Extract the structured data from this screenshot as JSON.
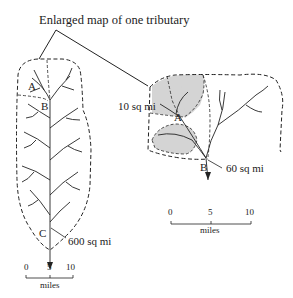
{
  "title": "Enlarged map of one tributary",
  "left_map": {
    "points": {
      "A": "A",
      "B": "B",
      "C": "C"
    },
    "area_label": "600 sq mi",
    "scale": {
      "ticks": [
        "0",
        "5",
        "10"
      ],
      "units": "miles"
    }
  },
  "right_map": {
    "points": {
      "A": "A",
      "B": "B"
    },
    "area_labels": {
      "A": "10 sq mi",
      "B": "60 sq mi"
    },
    "scale": {
      "ticks": [
        "0",
        "5",
        "10"
      ],
      "units": "miles"
    }
  },
  "colors": {
    "line": "#222222",
    "shade": "#d4d4d4"
  }
}
